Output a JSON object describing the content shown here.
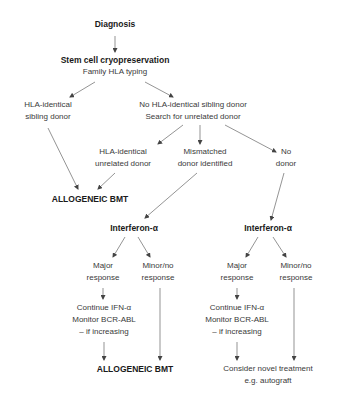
{
  "diagram": {
    "type": "flowchart",
    "nodes": {
      "diagnosis": {
        "lines": [
          "Diagnosis"
        ]
      },
      "stem_cell": {
        "lines": [
          "Stem cell cryopreservation",
          "Family HLA typing"
        ]
      },
      "hla_sibling": {
        "lines": [
          "HLA-identical",
          "sibling donor"
        ]
      },
      "no_sibling": {
        "lines": [
          "No HLA-identical sibling donor",
          "Search for unrelated donor"
        ]
      },
      "hla_unrelated": {
        "lines": [
          "HLA-identical",
          "unrelated donor"
        ]
      },
      "mismatched": {
        "lines": [
          "Mismatched",
          "donor identified"
        ]
      },
      "no_donor": {
        "lines": [
          "No",
          "donor"
        ]
      },
      "allo_bmt_1": {
        "lines": [
          "ALLOGENEIC BMT"
        ]
      },
      "ifn_left": {
        "lines": [
          "Interferon-α"
        ]
      },
      "ifn_right": {
        "lines": [
          "Interferon-α"
        ]
      },
      "major_left": {
        "lines": [
          "Major",
          "response"
        ]
      },
      "minor_left": {
        "lines": [
          "Minor/no",
          "response"
        ]
      },
      "major_right": {
        "lines": [
          "Major",
          "response"
        ]
      },
      "minor_right": {
        "lines": [
          "Minor/no",
          "response"
        ]
      },
      "continue_left": {
        "lines": [
          "Continue IFN-α",
          "Monitor BCR-ABL",
          "– if increasing"
        ]
      },
      "continue_right": {
        "lines": [
          "Continue IFN-α",
          "Monitor BCR-ABL",
          "– if increasing"
        ]
      },
      "allo_bmt_2": {
        "lines": [
          "ALLOGENEIC BMT"
        ]
      },
      "novel": {
        "lines": [
          "Consider novel treatment",
          "e.g. autograft"
        ]
      }
    },
    "edges": [
      [
        "diagnosis",
        "stem_cell"
      ],
      [
        "stem_cell",
        "hla_sibling"
      ],
      [
        "stem_cell",
        "no_sibling"
      ],
      [
        "no_sibling",
        "hla_unrelated"
      ],
      [
        "no_sibling",
        "mismatched"
      ],
      [
        "no_sibling",
        "no_donor"
      ],
      [
        "hla_sibling",
        "allo_bmt_1"
      ],
      [
        "hla_unrelated",
        "allo_bmt_1"
      ],
      [
        "mismatched",
        "ifn_left"
      ],
      [
        "no_donor",
        "ifn_right"
      ],
      [
        "ifn_left",
        "major_left"
      ],
      [
        "ifn_left",
        "minor_left"
      ],
      [
        "ifn_right",
        "major_right"
      ],
      [
        "ifn_right",
        "minor_right"
      ],
      [
        "major_left",
        "continue_left"
      ],
      [
        "major_right",
        "continue_right"
      ],
      [
        "continue_left",
        "allo_bmt_2"
      ],
      [
        "minor_left",
        "allo_bmt_2"
      ],
      [
        "continue_right",
        "novel"
      ],
      [
        "minor_right",
        "novel"
      ]
    ]
  }
}
